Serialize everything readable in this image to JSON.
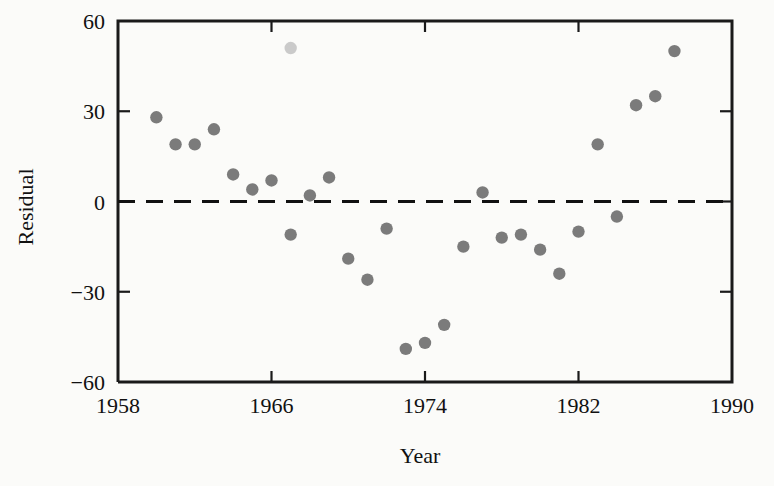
{
  "chart_data": {
    "type": "scatter",
    "title": "",
    "xlabel": "Year",
    "ylabel": "Residual",
    "xlim": [
      1958,
      1990
    ],
    "ylim": [
      -60,
      60
    ],
    "xticks": [
      1958,
      1966,
      1974,
      1982,
      1990
    ],
    "xtick_labels": [
      "1958",
      "1966",
      "1974",
      "1982",
      "1990"
    ],
    "yticks": [
      -60,
      -30,
      0,
      30,
      60
    ],
    "ytick_labels": [
      "−60",
      "−30",
      "0",
      "30",
      "60"
    ],
    "grid": false,
    "legend": null,
    "reference_lines": [
      {
        "name": "zero-residual-line",
        "axis": "y",
        "value": 0,
        "style": "dashed"
      }
    ],
    "x": [
      1960,
      1961,
      1962,
      1963,
      1964,
      1965,
      1966,
      1967,
      1967,
      1968,
      1969,
      1970,
      1971,
      1972,
      1973,
      1974,
      1975,
      1976,
      1977,
      1978,
      1979,
      1980,
      1981,
      1982,
      1983,
      1984,
      1985,
      1986,
      1987
    ],
    "y": [
      28,
      19,
      19,
      24,
      9,
      4,
      7,
      51,
      -11,
      2,
      8,
      -19,
      -26,
      -9,
      -49,
      -47,
      -41,
      -15,
      3,
      -12,
      -11,
      -16,
      -24,
      -10,
      19,
      -5,
      32,
      35,
      50
    ],
    "points": [
      {
        "year": 1960,
        "residual": 28,
        "faint": false
      },
      {
        "year": 1961,
        "residual": 19,
        "faint": false
      },
      {
        "year": 1962,
        "residual": 19,
        "faint": false
      },
      {
        "year": 1963,
        "residual": 24,
        "faint": false
      },
      {
        "year": 1964,
        "residual": 9,
        "faint": false
      },
      {
        "year": 1965,
        "residual": 4,
        "faint": false
      },
      {
        "year": 1966,
        "residual": 7,
        "faint": false
      },
      {
        "year": 1967,
        "residual": 51,
        "faint": true
      },
      {
        "year": 1967,
        "residual": -11,
        "faint": false
      },
      {
        "year": 1968,
        "residual": 2,
        "faint": false
      },
      {
        "year": 1969,
        "residual": 8,
        "faint": false
      },
      {
        "year": 1970,
        "residual": -19,
        "faint": false
      },
      {
        "year": 1971,
        "residual": -26,
        "faint": false
      },
      {
        "year": 1972,
        "residual": -9,
        "faint": false
      },
      {
        "year": 1973,
        "residual": -49,
        "faint": false
      },
      {
        "year": 1974,
        "residual": -47,
        "faint": false
      },
      {
        "year": 1975,
        "residual": -41,
        "faint": false
      },
      {
        "year": 1976,
        "residual": -15,
        "faint": false
      },
      {
        "year": 1977,
        "residual": 3,
        "faint": false
      },
      {
        "year": 1978,
        "residual": -12,
        "faint": false
      },
      {
        "year": 1979,
        "residual": -11,
        "faint": false
      },
      {
        "year": 1980,
        "residual": -16,
        "faint": false
      },
      {
        "year": 1981,
        "residual": -24,
        "faint": false
      },
      {
        "year": 1982,
        "residual": -10,
        "faint": false
      },
      {
        "year": 1983,
        "residual": 19,
        "faint": false
      },
      {
        "year": 1984,
        "residual": -5,
        "faint": false
      },
      {
        "year": 1985,
        "residual": 32,
        "faint": false
      },
      {
        "year": 1986,
        "residual": 35,
        "faint": false
      },
      {
        "year": 1987,
        "residual": 50,
        "faint": false
      }
    ],
    "marker_color": "#7b7b7b",
    "axis_color": "#1a1a1a",
    "background_color": "#fbfbf9"
  }
}
